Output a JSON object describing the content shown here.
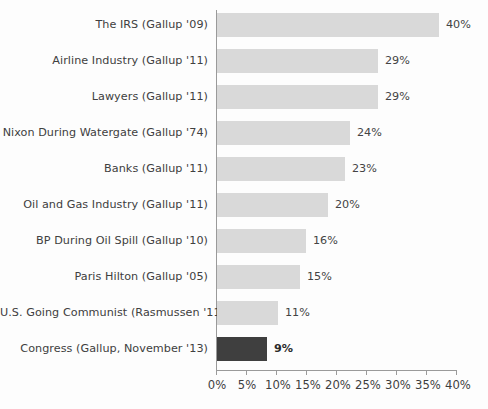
{
  "chart_data": {
    "type": "bar",
    "orientation": "horizontal",
    "title": "",
    "xlabel": "",
    "ylabel": "",
    "xlim": [
      0,
      40
    ],
    "grid": false,
    "legend": "none",
    "categories": [
      "The IRS (Gallup '09)",
      "Airline Industry (Gallup '11)",
      "Lawyers (Gallup '11)",
      "Nixon During Watergate (Gallup '74)",
      "Banks (Gallup '11)",
      "Oil and Gas Industry (Gallup '11)",
      "BP During Oil Spill (Gallup '10)",
      "Paris Hilton (Gallup '05)",
      "U.S. Going Communist (Rasmussen '11)",
      "Congress (Gallup, November '13)"
    ],
    "values": [
      40,
      29,
      29,
      24,
      23,
      20,
      16,
      15,
      11,
      9
    ],
    "value_labels": [
      "40%",
      "29%",
      "29%",
      "24%",
      "23%",
      "20%",
      "16%",
      "15%",
      "11%",
      "9%"
    ],
    "highlight_index": 9,
    "bar_color": "#d9d9d9",
    "highlight_color": "#3f3f3f",
    "axis_color": "#9a9a9a",
    "text_color": "#404040",
    "xticks": [
      0,
      5,
      10,
      15,
      20,
      25,
      30,
      35,
      40
    ],
    "xtick_labels": [
      "0%",
      "5%",
      "10%",
      "15%",
      "20%",
      "25%",
      "30%",
      "35%",
      "40%"
    ]
  }
}
